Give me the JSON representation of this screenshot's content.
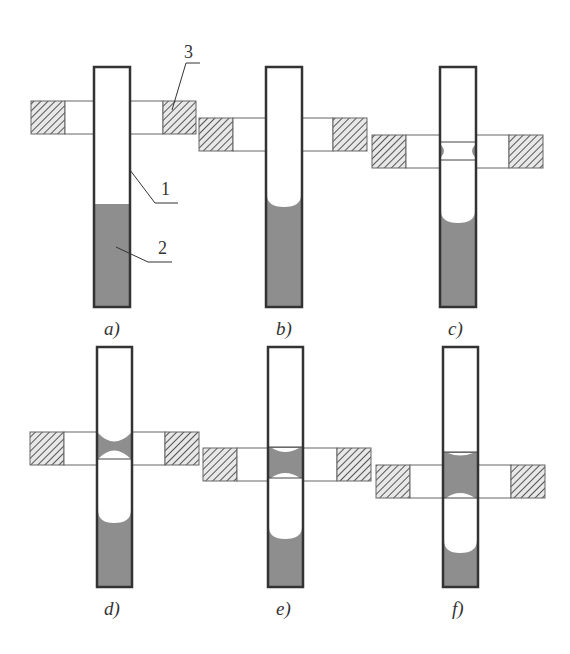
{
  "figure": {
    "colors": {
      "liquid": "#8e8e8e",
      "tube_outline": "#333333",
      "heater_hatch": "#555555",
      "background": "#ffffff"
    },
    "labels": {
      "tube": "1",
      "liquid": "2",
      "heater": "3"
    },
    "panels": [
      {
        "id": "a",
        "caption": "a)"
      },
      {
        "id": "b",
        "caption": "b)"
      },
      {
        "id": "c",
        "caption": "c)"
      },
      {
        "id": "d",
        "caption": "d)"
      },
      {
        "id": "e",
        "caption": "e)"
      },
      {
        "id": "f",
        "caption": "f)"
      }
    ]
  }
}
